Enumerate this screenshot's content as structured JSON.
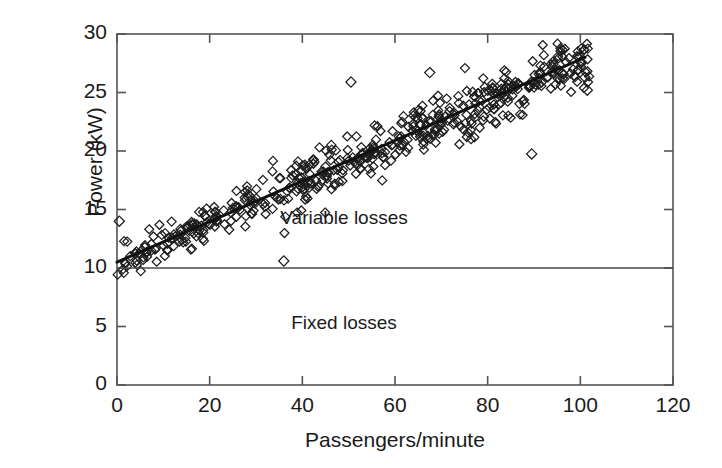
{
  "chart_data": {
    "type": "scatter",
    "title": "",
    "xlabel": "Passengers/minute",
    "ylabel": "Power (kW)",
    "xlim": [
      0,
      120
    ],
    "ylim": [
      0,
      30
    ],
    "xticks": [
      0,
      20,
      40,
      60,
      80,
      100,
      120
    ],
    "yticks": [
      0,
      5,
      10,
      15,
      20,
      25,
      30
    ],
    "xtick_labels": [
      "0",
      "20",
      "40",
      "60",
      "80",
      "100",
      "120"
    ],
    "ytick_labels": [
      "0",
      "5",
      "10",
      "15",
      "20",
      "25",
      "30"
    ],
    "grid": false,
    "legend": null,
    "marker": "open-diamond",
    "marker_size": 9,
    "series": [
      {
        "name": "Measured power",
        "type": "scatter",
        "n_points": 520,
        "description": "Open diamond markers rising roughly linearly from about 10 kW at 0 passengers/minute to about 27 kW at 100 passengers/minute, with scatter band of roughly +/- 2 kW widening slightly with x.",
        "fit_intercept": 10.5,
        "fit_slope": 0.173,
        "scatter_sd": 1.05,
        "x_min": 0,
        "x_max": 102,
        "outliers": [
          {
            "x": 36.0,
            "y": 10.6
          },
          {
            "x": 50.5,
            "y": 25.9
          },
          {
            "x": 67.5,
            "y": 26.7
          },
          {
            "x": 89.5,
            "y": 19.75
          },
          {
            "x": 101.0,
            "y": 26.3
          },
          {
            "x": 101.5,
            "y": 25.2
          },
          {
            "x": 0.5,
            "y": 14.0
          }
        ]
      },
      {
        "name": "Linear trend line",
        "type": "line",
        "x": [
          0,
          101
        ],
        "y": [
          10.5,
          28.0
        ],
        "color": "#111111",
        "width": 3
      },
      {
        "name": "Fixed loss level",
        "type": "hline",
        "y": 10,
        "x_span": [
          0,
          120
        ],
        "color": "#4a4a4a",
        "width": 1.4
      }
    ],
    "annotations": [
      {
        "text": "Variable losses",
        "x": 49,
        "y": 14.2
      },
      {
        "text": "Fixed losses",
        "x": 49,
        "y": 5.2
      }
    ]
  },
  "axes": {
    "frame_color": "#555555",
    "tick_color": "#555555"
  }
}
